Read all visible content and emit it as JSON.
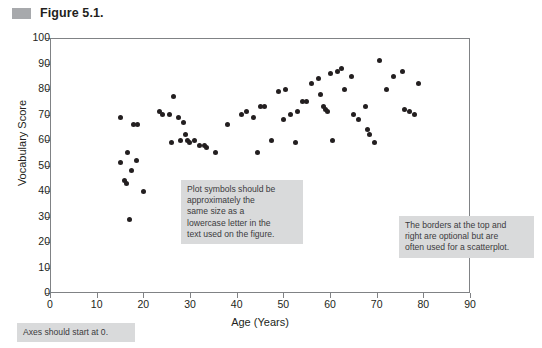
{
  "figure": {
    "caption": "Figure 5.1.",
    "swatch_color": "#a7a9ac"
  },
  "callouts": {
    "plot_symbols": [
      "Plot symbols should be",
      "approximately the",
      "same size as a",
      "lowercase letter in the",
      "text used on the figure."
    ],
    "borders": [
      "The borders at the top and",
      "right are optional but are",
      "often used for a scatterplot."
    ],
    "axes": [
      "Axes should start at 0."
    ],
    "background_color": "#d9dadb"
  },
  "chart_data": {
    "type": "scatter",
    "title": "",
    "xlabel": "Age (Years)",
    "ylabel": "Vocabulary Score",
    "xlim": [
      0,
      90
    ],
    "ylim": [
      0,
      100
    ],
    "xticks": [
      0,
      10,
      20,
      30,
      40,
      50,
      60,
      70,
      80,
      90
    ],
    "yticks": [
      0,
      10,
      20,
      30,
      40,
      50,
      60,
      70,
      80,
      90,
      100
    ],
    "grid": false,
    "legend": null,
    "marker_color": "#231f20",
    "marker_size_px": 5,
    "points": [
      {
        "x": 15.0,
        "y": 69
      },
      {
        "x": 15.2,
        "y": 51
      },
      {
        "x": 16.5,
        "y": 55
      },
      {
        "x": 16.0,
        "y": 44
      },
      {
        "x": 16.3,
        "y": 43
      },
      {
        "x": 17.5,
        "y": 48
      },
      {
        "x": 17.0,
        "y": 29
      },
      {
        "x": 17.8,
        "y": 66
      },
      {
        "x": 18.8,
        "y": 66
      },
      {
        "x": 18.5,
        "y": 52
      },
      {
        "x": 20.0,
        "y": 40
      },
      {
        "x": 23.5,
        "y": 71
      },
      {
        "x": 24.2,
        "y": 70
      },
      {
        "x": 25.5,
        "y": 70
      },
      {
        "x": 26.5,
        "y": 77
      },
      {
        "x": 26.0,
        "y": 59
      },
      {
        "x": 27.5,
        "y": 69
      },
      {
        "x": 28.0,
        "y": 60
      },
      {
        "x": 28.5,
        "y": 67
      },
      {
        "x": 29.0,
        "y": 62
      },
      {
        "x": 29.5,
        "y": 60
      },
      {
        "x": 29.8,
        "y": 59
      },
      {
        "x": 31.0,
        "y": 60
      },
      {
        "x": 32.0,
        "y": 58
      },
      {
        "x": 33.0,
        "y": 58
      },
      {
        "x": 33.5,
        "y": 57
      },
      {
        "x": 35.5,
        "y": 55
      },
      {
        "x": 38.0,
        "y": 66
      },
      {
        "x": 41.0,
        "y": 70
      },
      {
        "x": 42.0,
        "y": 71
      },
      {
        "x": 43.5,
        "y": 69
      },
      {
        "x": 45.0,
        "y": 73
      },
      {
        "x": 46.0,
        "y": 73
      },
      {
        "x": 44.5,
        "y": 55
      },
      {
        "x": 47.5,
        "y": 60
      },
      {
        "x": 49.0,
        "y": 79
      },
      {
        "x": 50.5,
        "y": 80
      },
      {
        "x": 50.0,
        "y": 68
      },
      {
        "x": 51.5,
        "y": 70
      },
      {
        "x": 53.0,
        "y": 71
      },
      {
        "x": 52.5,
        "y": 59
      },
      {
        "x": 54.0,
        "y": 75
      },
      {
        "x": 55.0,
        "y": 75
      },
      {
        "x": 56.0,
        "y": 82
      },
      {
        "x": 57.5,
        "y": 84
      },
      {
        "x": 58.0,
        "y": 78
      },
      {
        "x": 58.5,
        "y": 73
      },
      {
        "x": 59.0,
        "y": 72
      },
      {
        "x": 59.5,
        "y": 71
      },
      {
        "x": 60.0,
        "y": 86
      },
      {
        "x": 61.5,
        "y": 87
      },
      {
        "x": 62.5,
        "y": 88
      },
      {
        "x": 63.0,
        "y": 80
      },
      {
        "x": 64.5,
        "y": 85
      },
      {
        "x": 60.5,
        "y": 60
      },
      {
        "x": 65.0,
        "y": 70
      },
      {
        "x": 66.0,
        "y": 68
      },
      {
        "x": 67.5,
        "y": 73
      },
      {
        "x": 68.0,
        "y": 64
      },
      {
        "x": 68.5,
        "y": 62
      },
      {
        "x": 69.5,
        "y": 59
      },
      {
        "x": 70.5,
        "y": 91
      },
      {
        "x": 72.0,
        "y": 80
      },
      {
        "x": 73.5,
        "y": 85
      },
      {
        "x": 75.5,
        "y": 87
      },
      {
        "x": 76.0,
        "y": 72
      },
      {
        "x": 77.0,
        "y": 71
      },
      {
        "x": 78.0,
        "y": 70
      },
      {
        "x": 79.0,
        "y": 82
      }
    ]
  }
}
